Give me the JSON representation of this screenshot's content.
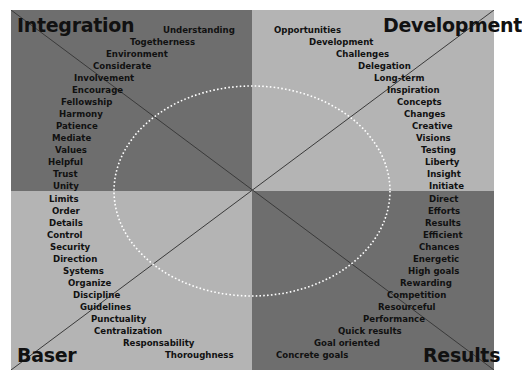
{
  "colors": {
    "dark_quadrant": "#6e6e6e",
    "light_quadrant": "#b4b4b4",
    "diagonal": "#3a3a3a",
    "ellipse": "#ffffff",
    "text": "#111111"
  },
  "quadrants": {
    "integration": {
      "title": "Integration",
      "words": [
        "Understanding",
        "Togetherness",
        "Environment",
        "Considerate",
        "Involvement",
        "Encourage",
        "Fellowship",
        "Harmony",
        "Patience",
        "Mediate",
        "Values",
        "Helpful",
        "Trust",
        "Unity"
      ]
    },
    "development": {
      "title": "Development",
      "words": [
        "Opportunities",
        "Development",
        "Challenges",
        "Delegation",
        "Long-term",
        "Inspiration",
        "Concepts",
        "Changes",
        "Creative",
        "Visions",
        "Testing",
        "Liberty",
        "Insight",
        "Initiate"
      ]
    },
    "baser": {
      "title": "Baser",
      "words": [
        "Limits",
        "Order",
        "Details",
        "Control",
        "Security",
        "Direction",
        "Systems",
        "Organize",
        "Discipline",
        "Guidelines",
        "Punctuality",
        "Centralization",
        "Responsability",
        "Thoroughness"
      ]
    },
    "results": {
      "title": "Results",
      "words": [
        "Direct",
        "Efforts",
        "Results",
        "Efficient",
        "Chances",
        "Energetic",
        "High goals",
        "Rewarding",
        "Competition",
        "Resourceful",
        "Performance",
        "Quick results",
        "Goal oriented",
        "Concrete goals"
      ]
    }
  }
}
